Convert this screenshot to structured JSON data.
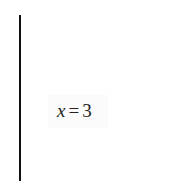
{
  "chart_data": {
    "type": "line",
    "title": "",
    "xlabel": "",
    "ylabel": "",
    "grid": false,
    "series": [
      {
        "name": "x = 3",
        "kind": "vertical-line",
        "x": 3
      }
    ],
    "annotations": [
      {
        "text": "x = 3",
        "variable": "x",
        "operator": "=",
        "value": "3"
      }
    ]
  },
  "colors": {
    "line": "#111111",
    "label_text": "#222222",
    "label_background": "#fbfbfb",
    "background": "#ffffff"
  }
}
